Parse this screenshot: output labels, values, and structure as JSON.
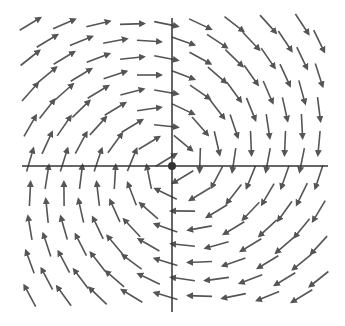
{
  "diagram": {
    "type": "vector-field",
    "colors": {
      "background": "#ffffff",
      "arrow": "#555555",
      "axis": "#333333",
      "origin": "#333333"
    },
    "origin_px": [
      172,
      166
    ],
    "axes": {
      "x": {
        "from": 22,
        "to": 328
      },
      "y": {
        "from": 18,
        "to": 312
      }
    },
    "grid": {
      "spacing": 34,
      "stagger_offset": 17,
      "x_range": [
        30,
        320
      ],
      "y_range": [
        24,
        305
      ]
    },
    "arrow_length": 24,
    "field_rule": "direction = (dy, -dx) rotated slightly inward, where (dx,dy) is offset from origin in math coords"
  }
}
